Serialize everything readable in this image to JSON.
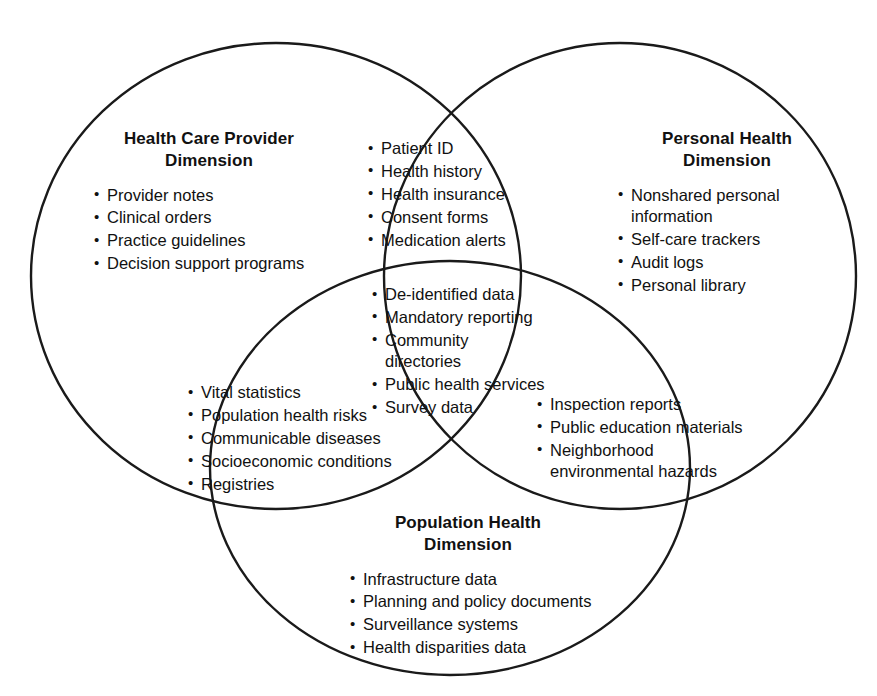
{
  "diagram": {
    "type": "venn-3-set",
    "canvas": {
      "width": 877,
      "height": 696
    },
    "stroke_color": "#1a1a1a",
    "background_color": "#ffffff",
    "sets": [
      {
        "id": "health-care-provider",
        "title": "Health Care Provider\nDimension",
        "items": [
          "Provider notes",
          "Clinical orders",
          "Practice guidelines",
          "Decision support programs"
        ]
      },
      {
        "id": "personal-health",
        "title": "Personal Health\nDimension",
        "items": [
          "Nonshared personal\ninformation",
          "Self-care trackers",
          "Audit logs",
          "Personal library"
        ]
      },
      {
        "id": "population-health",
        "title": "Population Health\nDimension",
        "items": [
          "Infrastructure data",
          "Planning and policy documents",
          "Surveillance systems",
          "Health disparities data"
        ]
      }
    ],
    "intersections": [
      {
        "id": "provider-personal",
        "items": [
          "Patient ID",
          "Health history",
          "Health insurance",
          "Consent forms",
          "Medication alerts"
        ]
      },
      {
        "id": "provider-population",
        "items": [
          "Vital statistics",
          "Population health risks",
          "Communicable diseases",
          "Socioeconomic conditions",
          "Registries"
        ]
      },
      {
        "id": "personal-population",
        "items": [
          "Inspection reports",
          "Public education materials",
          "Neighborhood\nenvironmental hazards"
        ]
      },
      {
        "id": "all-three",
        "items": [
          "De-identified data",
          "Mandatory reporting",
          "Community\ndirectories",
          "Public health services",
          "Survey data"
        ]
      }
    ]
  }
}
